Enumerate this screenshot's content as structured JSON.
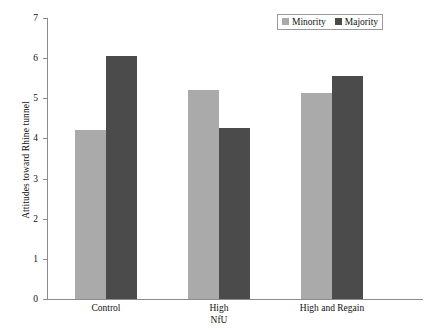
{
  "chart_data": {
    "type": "bar",
    "title": "",
    "xlabel": "",
    "ylabel": "Attitudes toward Rhine tunnel",
    "ylim": [
      0,
      7
    ],
    "grid": false,
    "legend_position": "top-right",
    "categories": [
      "Control",
      "High\nNfU",
      "High and Regain"
    ],
    "category_lines": [
      [
        "Control"
      ],
      [
        "High",
        "NfU"
      ],
      [
        "High and Regain"
      ]
    ],
    "ytick_labels": [
      "7",
      "6",
      "5",
      "4",
      "3",
      "2",
      "1",
      "0"
    ],
    "ytick_values": [
      7,
      6,
      5,
      4,
      3,
      2,
      1,
      0
    ],
    "series": [
      {
        "name": "Minority",
        "color": "#aaaaaa",
        "values": [
          4.22,
          5.2,
          5.12
        ]
      },
      {
        "name": "Majority",
        "color": "#4b4b4b",
        "values": [
          6.05,
          4.25,
          5.55
        ]
      }
    ]
  },
  "legend": {
    "entries": [
      {
        "label": "Minority",
        "color": "#aaaaaa"
      },
      {
        "label": "Majority",
        "color": "#4b4b4b"
      }
    ]
  },
  "axes": {
    "y_title": "Attitudes toward Rhine tunnel"
  }
}
